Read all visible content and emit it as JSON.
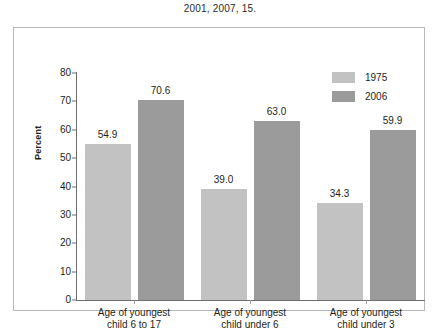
{
  "caption": "2001, 2007, 15.",
  "chart_data": {
    "type": "bar",
    "title": "",
    "xlabel": "",
    "ylabel": "Percent",
    "ylim": [
      0,
      80
    ],
    "yticks": [
      0,
      10,
      20,
      30,
      40,
      50,
      60,
      70,
      80
    ],
    "grid": false,
    "legend_position": "top-right",
    "categories": [
      "Age of youngest\nchild 6 to 17",
      "Age of youngest\nchild under 6",
      "Age of youngest\nchild under 3"
    ],
    "category_lines": [
      [
        "Age of youngest",
        "child 6 to 17"
      ],
      [
        "Age of youngest",
        "child under 6"
      ],
      [
        "Age of youngest",
        "child under 3"
      ]
    ],
    "series": [
      {
        "name": "1975",
        "color": "#c2c2c2",
        "values": [
          54.9,
          39.0,
          34.3
        ],
        "labels": [
          "54.9",
          "39.0",
          "34.3"
        ]
      },
      {
        "name": "2006",
        "color": "#9b9b9b",
        "values": [
          70.6,
          63.0,
          59.9
        ],
        "labels": [
          "70.6",
          "63.0",
          "59.9"
        ]
      }
    ]
  },
  "legend": {
    "items": [
      {
        "label": "1975"
      },
      {
        "label": "2006"
      }
    ]
  },
  "colors": {
    "series_1975": "#c2c2c2",
    "series_2006": "#9b9b9b",
    "axis": "#6e6e6e",
    "frame": "#b9b9b9",
    "text": "#231f20"
  }
}
